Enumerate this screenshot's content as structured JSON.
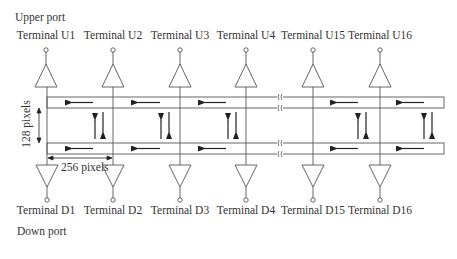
{
  "diagram": {
    "upper_port_label": "Upper port",
    "down_port_label": "Down port",
    "upper_terminals": [
      "Terminal U1",
      "Terminal U2",
      "Terminal U3",
      "Terminal U4",
      "Terminal U15",
      "Terminal U16"
    ],
    "down_terminals": [
      "Terminal D1",
      "Terminal D2",
      "Terminal D3",
      "Terminal D4",
      "Terminal D15",
      "Terminal D16"
    ],
    "height_dimension": "128 pixels",
    "width_dimension": "256 pixels",
    "colors": {
      "line": "#555555",
      "arrow": "#222222"
    }
  }
}
